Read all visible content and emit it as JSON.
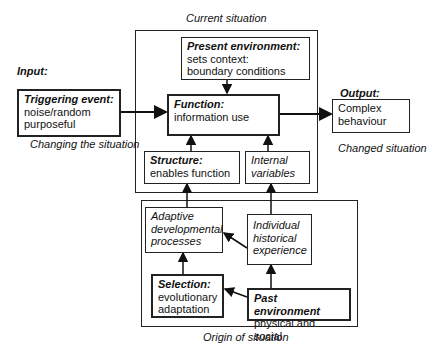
{
  "labels": {
    "input": "Input:",
    "output": "Output:",
    "current_situation": "Current situation",
    "changing_situation": "Changing the situation",
    "changed_situation": "Changed situation",
    "origin_situation": "Origin of situation"
  },
  "boxes": {
    "triggering": {
      "title": "Triggering event:",
      "lines": [
        "noise/random",
        "purposeful"
      ]
    },
    "present": {
      "title": "Present environment:",
      "lines": [
        "sets context:",
        "boundary conditions"
      ]
    },
    "function": {
      "title": "Function:",
      "lines": [
        "information use"
      ]
    },
    "output": {
      "lines": [
        "Complex",
        "behaviour"
      ]
    },
    "structure": {
      "title": "Structure:",
      "lines": [
        "enables function"
      ]
    },
    "internal": {
      "lines": [
        "Internal",
        "variables"
      ]
    },
    "adaptive": {
      "lines": [
        "Adaptive",
        "developmental",
        "processes"
      ]
    },
    "individual": {
      "lines": [
        "Individual",
        "historical",
        "experience"
      ]
    },
    "selection": {
      "title": "Selection:",
      "lines": [
        "evolutionary",
        "adaptation"
      ]
    },
    "past": {
      "title": "Past environment",
      "lines": [
        "physical and social"
      ]
    }
  }
}
